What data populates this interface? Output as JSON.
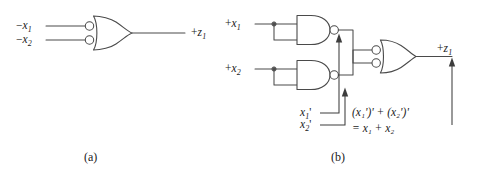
{
  "figure": {
    "type": "logic-circuit-diagram",
    "background_color": "#ffffff",
    "line_color": "#4a4a4a"
  },
  "panels": [
    {
      "id": "a",
      "caption": "(a)",
      "description": "OR gate with two inverted (bubbled) inputs",
      "inputs": [
        {
          "sign": "−",
          "var": "x",
          "sub": "1",
          "text": "−x₁"
        },
        {
          "sign": "−",
          "var": "x",
          "sub": "2",
          "text": "−x₂"
        }
      ],
      "outputs": [
        {
          "sign": "+",
          "var": "z",
          "sub": "1",
          "text": "+z₁"
        }
      ],
      "gates": [
        {
          "kind": "or",
          "inverted_inputs": true,
          "inverted_output": false
        }
      ]
    },
    {
      "id": "b",
      "caption": "(b)",
      "description": "Two NAND gates (inputs tied together) feeding an OR gate with inverted inputs",
      "inputs": [
        {
          "sign": "+",
          "var": "x",
          "sub": "1",
          "text": "+x₁"
        },
        {
          "sign": "+",
          "var": "x",
          "sub": "2",
          "text": "+x₂"
        }
      ],
      "outputs": [
        {
          "sign": "+",
          "var": "z",
          "sub": "1",
          "text": "+z₁"
        }
      ],
      "gates": [
        {
          "kind": "nand",
          "inverted_inputs": false,
          "inverted_output": true
        },
        {
          "kind": "nand",
          "inverted_inputs": false,
          "inverted_output": true
        },
        {
          "kind": "or",
          "inverted_inputs": true,
          "inverted_output": false
        }
      ],
      "annotations": [
        {
          "id": "nand1-out",
          "text": "x₁'",
          "var": "x",
          "sub": "1",
          "prime": "'"
        },
        {
          "id": "nand2-out",
          "text": "x₂'",
          "var": "x",
          "sub": "2",
          "prime": "'"
        },
        {
          "id": "or-out",
          "line1": "(x₁')' + (x₂')'",
          "line2": "= x₁ + x₂"
        }
      ]
    }
  ]
}
